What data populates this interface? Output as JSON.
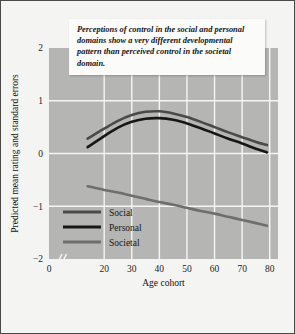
{
  "caption": {
    "text": "Perceptions of control in the social and personal domains show a very different developmental pattern than perceived control in the societal domain."
  },
  "colors": {
    "plot_background": "#b5b5b3",
    "figure_background": "#f4f4f2",
    "gridline": "#f6f6f4",
    "social": "#4a4a4a",
    "personal": "#171717",
    "societal": "#6e6e6e",
    "text": "#141414"
  },
  "legend": {
    "position": "inside-lower-left",
    "entries": [
      {
        "label": "Social",
        "color": "#4a4a4a"
      },
      {
        "label": "Personal",
        "color": "#171717"
      },
      {
        "label": "Societal",
        "color": "#6e6e6e"
      }
    ]
  },
  "chart_data": {
    "type": "line",
    "title": "",
    "xlabel": "Age cohort",
    "ylabel": "Predicted mean rating and standard errors",
    "xlim": [
      0,
      83
    ],
    "ylim": [
      -2,
      2
    ],
    "grid": true,
    "axis_break": {
      "axis": "x",
      "between": [
        0,
        14
      ]
    },
    "xticks": [
      0,
      20,
      30,
      40,
      50,
      60,
      70,
      80
    ],
    "xtick_labels": [
      "0",
      "20",
      "30",
      "40",
      "50",
      "60",
      "70",
      "80"
    ],
    "yticks": [
      2,
      1,
      0,
      -1,
      -2
    ],
    "ytick_labels": [
      "2",
      "1",
      "0",
      "-1",
      "-2"
    ],
    "x": [
      14,
      20,
      25,
      30,
      35,
      40,
      45,
      50,
      55,
      60,
      65,
      70,
      75,
      79
    ],
    "series": [
      {
        "name": "Social",
        "color": "#4a4a4a",
        "values": [
          0.28,
          0.47,
          0.62,
          0.73,
          0.79,
          0.8,
          0.76,
          0.69,
          0.6,
          0.5,
          0.4,
          0.31,
          0.22,
          0.16
        ]
      },
      {
        "name": "Personal",
        "color": "#171717",
        "values": [
          0.12,
          0.33,
          0.49,
          0.6,
          0.66,
          0.67,
          0.64,
          0.57,
          0.48,
          0.38,
          0.28,
          0.19,
          0.09,
          0.02
        ]
      },
      {
        "name": "Societal",
        "color": "#6e6e6e",
        "values": [
          -0.62,
          -0.69,
          -0.74,
          -0.8,
          -0.86,
          -0.92,
          -0.97,
          -1.03,
          -1.09,
          -1.14,
          -1.2,
          -1.26,
          -1.32,
          -1.37
        ]
      }
    ]
  }
}
